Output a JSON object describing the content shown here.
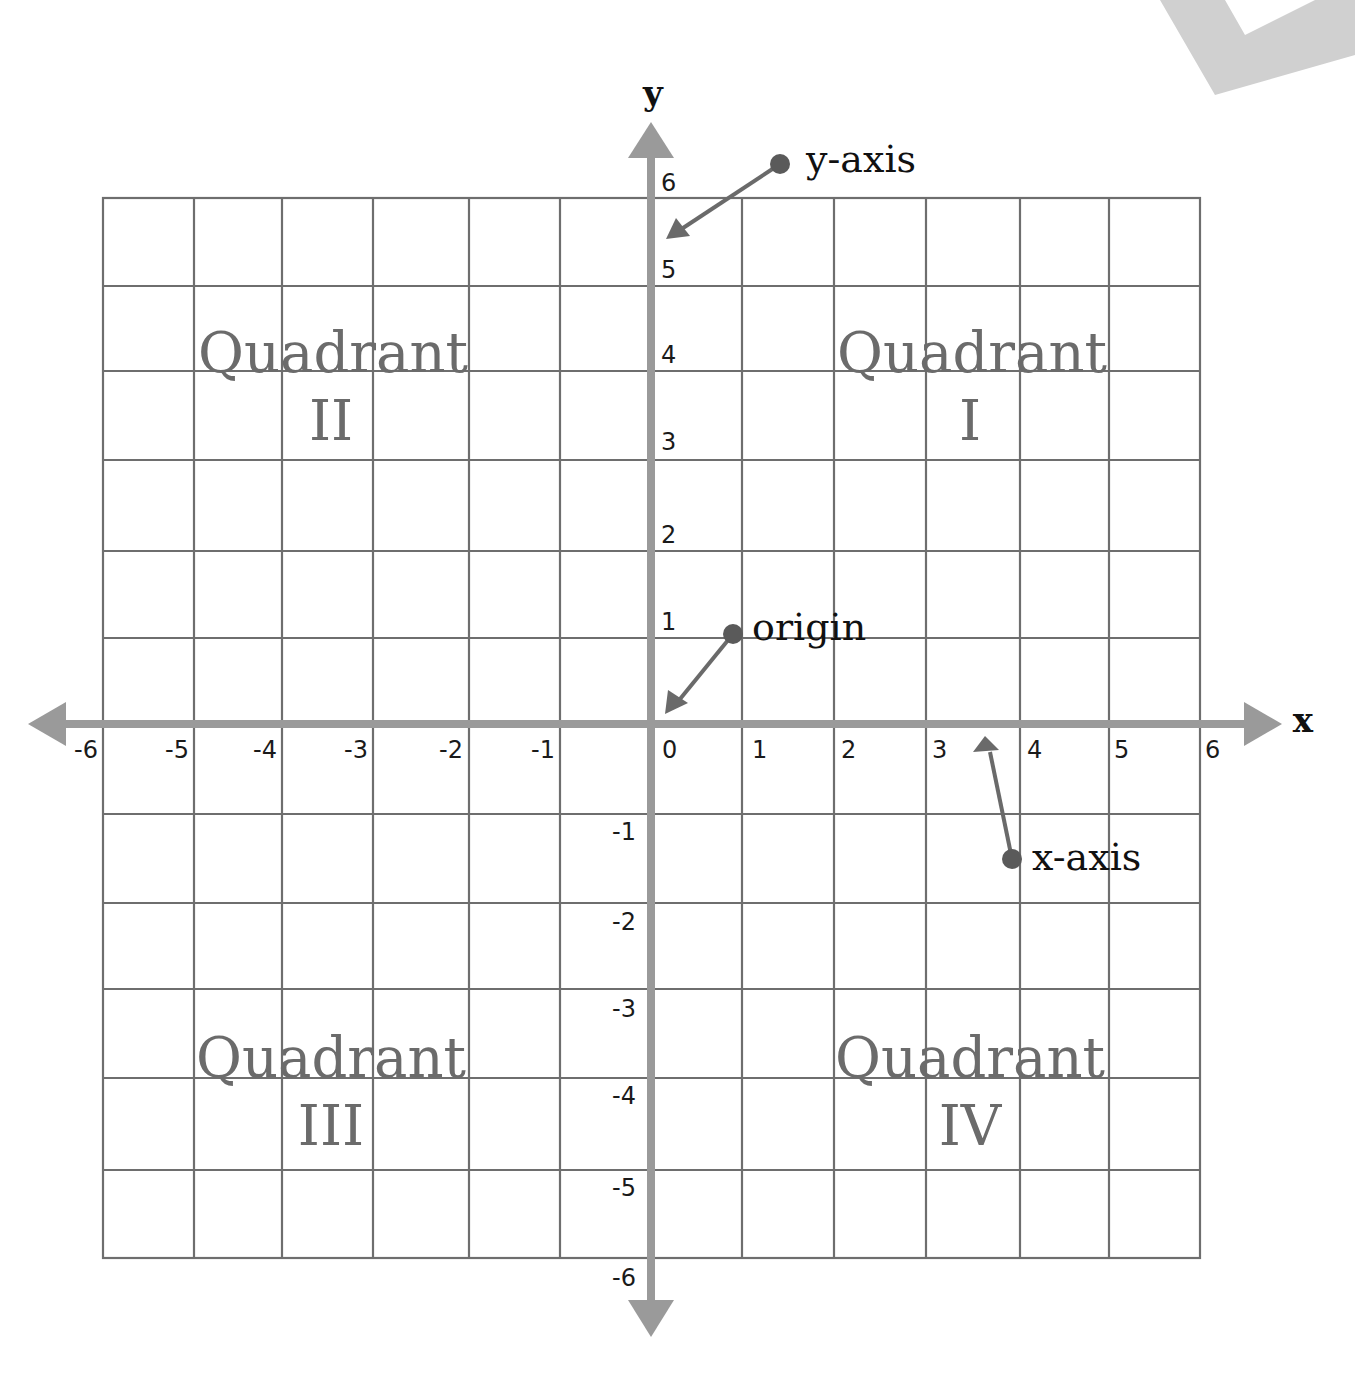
{
  "diagram": {
    "title": "",
    "axes": {
      "x_label": "x",
      "y_label": "y",
      "x_ticks": [
        "-6",
        "-5",
        "-4",
        "-3",
        "-2",
        "-1",
        "0",
        "1",
        "2",
        "3",
        "4",
        "5",
        "6"
      ],
      "y_ticks_positive": [
        "6",
        "5",
        "4",
        "3",
        "2",
        "1"
      ],
      "y_ticks_negative": [
        "-1",
        "-2",
        "-3",
        "-4",
        "-5",
        "-6"
      ]
    },
    "quadrants": [
      {
        "word": "Quadrant",
        "numeral": "I"
      },
      {
        "word": "Quadrant",
        "numeral": "II"
      },
      {
        "word": "Quadrant",
        "numeral": "III"
      },
      {
        "word": "Quadrant",
        "numeral": "IV"
      }
    ],
    "callouts": {
      "y_axis": "y-axis",
      "origin": "origin",
      "x_axis": "x-axis"
    },
    "colors": {
      "grid": "#6e6e6e",
      "axis": "#9a9a9a",
      "callout_arrow": "#6a6a6a",
      "quadrant_text": "#6b6b6b",
      "text": "#111111",
      "corner_shape": "#d0d0d0"
    }
  }
}
